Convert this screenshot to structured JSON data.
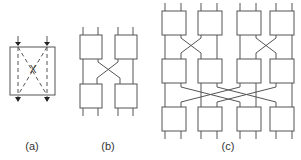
{
  "panels": [
    {
      "id": "a",
      "label": "(a)",
      "description": "Single box with two top inputs and two bottom outputs (arrows), dashed internal crossover marked X",
      "center_mark": "X"
    },
    {
      "id": "b",
      "label": "(b)",
      "description": "Two stages of two boxes each, inner wires crossed between stages"
    },
    {
      "id": "c",
      "label": "(c)",
      "description": "Three stages of four boxes each; stage 1-2 crossings within pairs, stage 2-3 crossings across halves"
    }
  ],
  "colors": {
    "stroke": "#555555",
    "text": "#333333",
    "background": "#ffffff"
  }
}
